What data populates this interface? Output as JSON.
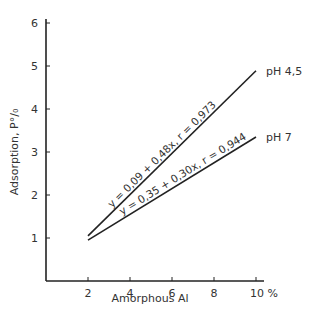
{
  "chart_data": {
    "type": "line",
    "title": "",
    "xlabel": "Amorphous  Al",
    "ylabel": "Adsorption, P°/₀",
    "x_unit": "%",
    "xlim": [
      0,
      10
    ],
    "ylim": [
      0,
      6
    ],
    "x_ticks": [
      2,
      4,
      6,
      8,
      10
    ],
    "x_tick_labels": [
      "2",
      "4",
      "6",
      "8",
      "10 %"
    ],
    "y_ticks": [
      1,
      2,
      3,
      4,
      5,
      6
    ],
    "y_tick_labels": [
      "1",
      "2",
      "3",
      "4",
      "5",
      "6"
    ],
    "grid": false,
    "series": [
      {
        "name": "pH 4,5",
        "equation": "y = 0,09 + 0,48x, r = 0,973",
        "intercept": 0.09,
        "slope": 0.48,
        "r": 0.973,
        "x": [
          2,
          10
        ],
        "values": [
          1.05,
          4.89
        ]
      },
      {
        "name": "pH 7",
        "equation": "y = 0,35 + 0,30x, r = 0,944",
        "intercept": 0.35,
        "slope": 0.3,
        "r": 0.944,
        "x": [
          2,
          10
        ],
        "values": [
          0.95,
          3.35
        ]
      }
    ]
  }
}
